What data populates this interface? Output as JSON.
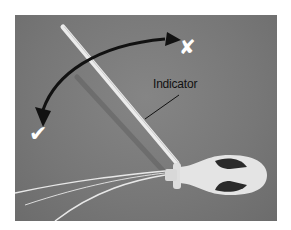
{
  "image": {
    "description": "Grayscale photo of a probe device with a long white indicator rod attached to a handle, with curved arrows showing rotation direction",
    "annotations": {
      "indicator_label": "Indicator",
      "correct_mark": "✔",
      "incorrect_mark": "✘"
    },
    "colors": {
      "background": "#777777",
      "rod": "#e6e6e6",
      "arrow": "#111111",
      "mark": "#ffffff"
    }
  }
}
